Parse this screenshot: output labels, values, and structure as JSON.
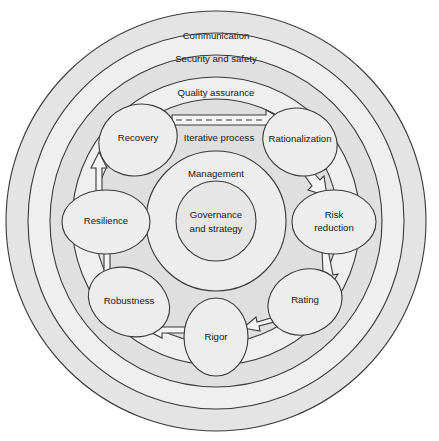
{
  "diagram": {
    "type": "concentric-cycle",
    "colors": {
      "page_background": "#ffffff",
      "ring_band_light": "#eeeeee",
      "ring_band_dark": "#dadada",
      "node_fill": "#ededed",
      "stroke": "#3a3a3a",
      "text": "#17181a",
      "arrow_fill": "#f2f2f2"
    },
    "rings": [
      {
        "id": "communication",
        "label": "Communication",
        "order": 1
      },
      {
        "id": "security-and-safety",
        "label": "Security and safety",
        "order": 2
      },
      {
        "id": "quality-assurance",
        "label": "Quality assurance",
        "order": 3
      }
    ],
    "core": {
      "management_label": "Management",
      "center_line_1": "Governance",
      "center_line_2": "and strategy"
    },
    "flow": {
      "iterative_label": "Iterative process",
      "direction": "clockwise",
      "arrow_style": "hollow-block"
    },
    "nodes": [
      {
        "id": "recovery",
        "label": "Recovery",
        "angle_deg": 235,
        "line2": ""
      },
      {
        "id": "rationalization",
        "label": "Rationalization",
        "angle_deg": 305,
        "line2": ""
      },
      {
        "id": "risk-reduction",
        "label": "Risk",
        "line2": "reduction",
        "angle_deg": 355
      },
      {
        "id": "rating",
        "label": "Rating",
        "angle_deg": 55,
        "line2": ""
      },
      {
        "id": "rigor",
        "label": "Rigor",
        "angle_deg": 90,
        "line2": ""
      },
      {
        "id": "robustness",
        "label": "Robustness",
        "angle_deg": 125,
        "line2": ""
      },
      {
        "id": "resilience",
        "label": "Resilience",
        "angle_deg": 180,
        "line2": ""
      }
    ],
    "transitions": [
      {
        "from": "recovery",
        "to": "rationalization",
        "label": "Iterative process"
      },
      {
        "from": "rationalization",
        "to": "risk-reduction",
        "label": ""
      },
      {
        "from": "risk-reduction",
        "to": "rating",
        "label": ""
      },
      {
        "from": "rating",
        "to": "rigor",
        "label": ""
      },
      {
        "from": "rigor",
        "to": "robustness",
        "label": ""
      },
      {
        "from": "robustness",
        "to": "resilience",
        "label": ""
      },
      {
        "from": "resilience",
        "to": "recovery",
        "label": ""
      }
    ]
  }
}
